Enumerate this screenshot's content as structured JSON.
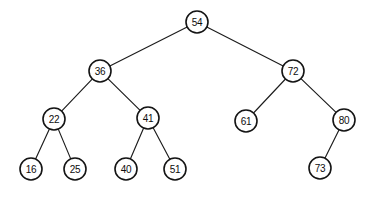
{
  "figure": {
    "kind": "binary-search-tree-diagram",
    "background_color": "#ffffff",
    "stroke_color": "#141414",
    "width": 369,
    "height": 197,
    "node_radius": 11
  },
  "tree": {
    "root_value": "54",
    "nodes": [
      {
        "id": "n54",
        "label": "54",
        "cx": 197,
        "cy": 22,
        "level": 1
      },
      {
        "id": "n36",
        "label": "36",
        "cx": 100,
        "cy": 71,
        "level": 2
      },
      {
        "id": "n72",
        "label": "72",
        "cx": 293,
        "cy": 71,
        "level": 2
      },
      {
        "id": "n22",
        "label": "22",
        "cx": 54,
        "cy": 119,
        "level": 3
      },
      {
        "id": "n41",
        "label": "41",
        "cx": 148,
        "cy": 118,
        "level": 3
      },
      {
        "id": "n61",
        "label": "61",
        "cx": 246,
        "cy": 121,
        "level": 3
      },
      {
        "id": "n80",
        "label": "80",
        "cx": 344,
        "cy": 120,
        "level": 3
      },
      {
        "id": "n16",
        "label": "16",
        "cx": 31,
        "cy": 169,
        "level": 4
      },
      {
        "id": "n25",
        "label": "25",
        "cx": 75,
        "cy": 169,
        "level": 4
      },
      {
        "id": "n40",
        "label": "40",
        "cx": 126,
        "cy": 169,
        "level": 4
      },
      {
        "id": "n51",
        "label": "51",
        "cx": 175,
        "cy": 169,
        "level": 4
      },
      {
        "id": "n73",
        "label": "73",
        "cx": 320,
        "cy": 168,
        "level": 4
      }
    ],
    "edges": [
      {
        "id": "e54-36",
        "from": "n54",
        "to": "n36",
        "side": "left"
      },
      {
        "id": "e54-72",
        "from": "n54",
        "to": "n72",
        "side": "right"
      },
      {
        "id": "e36-22",
        "from": "n36",
        "to": "n22",
        "side": "left"
      },
      {
        "id": "e36-41",
        "from": "n36",
        "to": "n41",
        "side": "right"
      },
      {
        "id": "e72-61",
        "from": "n72",
        "to": "n61",
        "side": "left"
      },
      {
        "id": "e72-80",
        "from": "n72",
        "to": "n80",
        "side": "right"
      },
      {
        "id": "e22-16",
        "from": "n22",
        "to": "n16",
        "side": "left"
      },
      {
        "id": "e22-25",
        "from": "n22",
        "to": "n25",
        "side": "right"
      },
      {
        "id": "e41-40",
        "from": "n41",
        "to": "n40",
        "side": "left"
      },
      {
        "id": "e41-51",
        "from": "n41",
        "to": "n51",
        "side": "right"
      },
      {
        "id": "e80-73",
        "from": "n80",
        "to": "n73",
        "side": "left"
      }
    ]
  },
  "chart_data": {
    "type": "diagram",
    "title": "",
    "values": [
      "54",
      "36",
      "72",
      "22",
      "41",
      "61",
      "80",
      "16",
      "25",
      "40",
      "51",
      "73"
    ]
  }
}
